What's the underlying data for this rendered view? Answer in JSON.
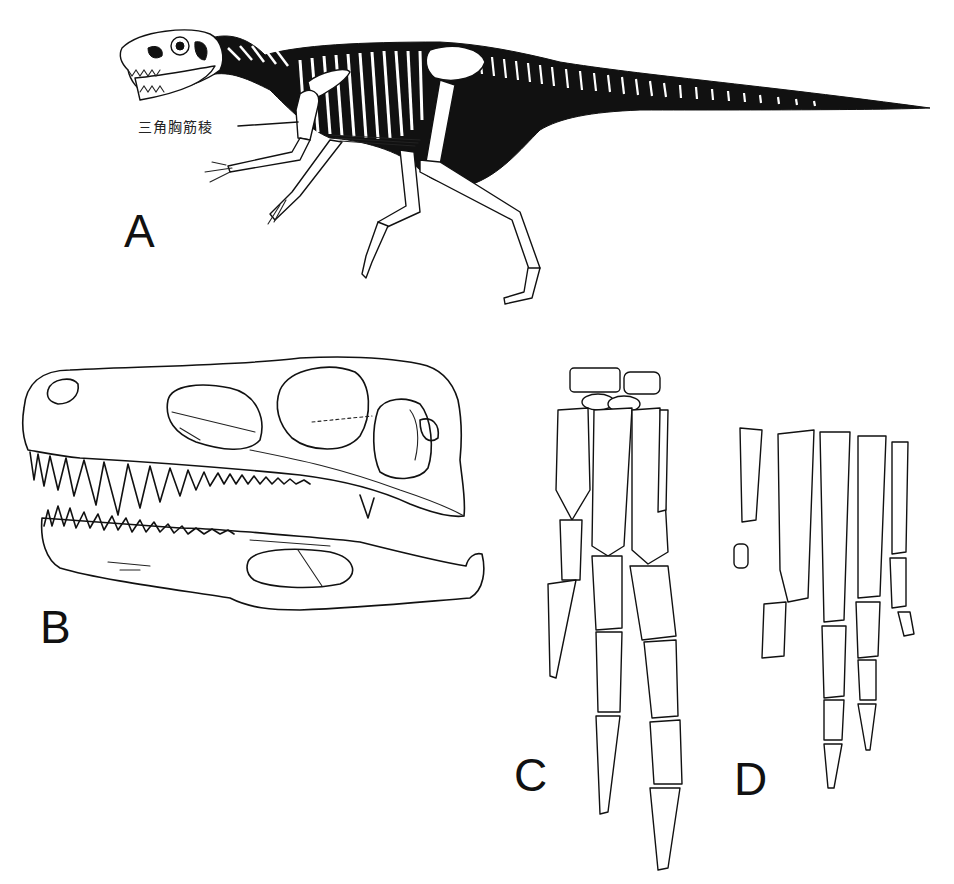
{
  "figure": {
    "panels": [
      {
        "id": "A",
        "letter": "A",
        "subject": "full-skeleton-lateral-view",
        "callouts": [
          {
            "label": "三角胸筋稜"
          }
        ]
      },
      {
        "id": "B",
        "letter": "B",
        "subject": "skull-lateral-view"
      },
      {
        "id": "C",
        "letter": "C",
        "subject": "manus-hand-bones"
      },
      {
        "id": "D",
        "letter": "D",
        "subject": "pes-foot-bones"
      }
    ],
    "colors": {
      "background": "#ffffff",
      "ink": "#111111",
      "silhouette": "#111111"
    }
  }
}
